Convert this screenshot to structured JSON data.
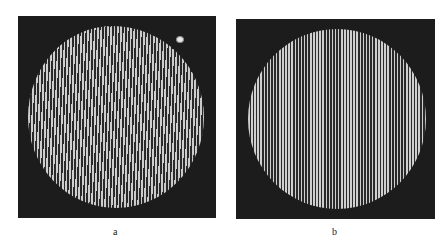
{
  "figure": {
    "panels": [
      {
        "id": "a",
        "label": "a",
        "description": "Circular interference fringe pattern with slightly curved vertical fringes on dark background",
        "background_color": "#1c1c1c",
        "fringe_light_color": "#cfcfcf",
        "fringe_dark_color": "#2a2a2a",
        "has_bright_spot": true
      },
      {
        "id": "b",
        "label": "b",
        "description": "Circular interference fringe pattern with straight vertical fringes on dark background",
        "background_color": "#1c1c1c",
        "fringe_light_color": "#cfcfcf",
        "fringe_dark_color": "#2a2a2a",
        "has_bright_spot": false
      }
    ]
  }
}
